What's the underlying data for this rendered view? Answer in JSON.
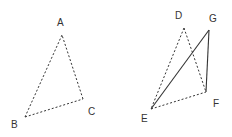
{
  "diagram": {
    "points": {
      "A": {
        "label": "A",
        "x": 62,
        "y": 35,
        "lx": 57,
        "ly": 26
      },
      "B": {
        "label": "B",
        "x": 25,
        "y": 117,
        "lx": 11,
        "ly": 128
      },
      "C": {
        "label": "C",
        "x": 83,
        "y": 99,
        "lx": 88,
        "ly": 115
      },
      "D": {
        "label": "D",
        "x": 184,
        "y": 28,
        "lx": 175,
        "ly": 19
      },
      "E": {
        "label": "E",
        "x": 151,
        "y": 109,
        "lx": 141,
        "ly": 122
      },
      "F": {
        "label": "F",
        "x": 206,
        "y": 92,
        "lx": 213,
        "ly": 107
      },
      "G": {
        "label": "G",
        "x": 209,
        "y": 30,
        "lx": 209,
        "ly": 22
      }
    },
    "segments": [
      {
        "from": "A",
        "to": "B",
        "style": "dashed"
      },
      {
        "from": "B",
        "to": "C",
        "style": "dashed"
      },
      {
        "from": "C",
        "to": "A",
        "style": "dashed"
      },
      {
        "from": "D",
        "to": "E",
        "style": "dashed"
      },
      {
        "from": "D",
        "to": "F",
        "style": "dashed"
      },
      {
        "from": "E",
        "to": "F",
        "style": "dashed"
      },
      {
        "from": "E",
        "to": "G",
        "style": "solid"
      },
      {
        "from": "G",
        "to": "F",
        "style": "solid"
      }
    ]
  }
}
